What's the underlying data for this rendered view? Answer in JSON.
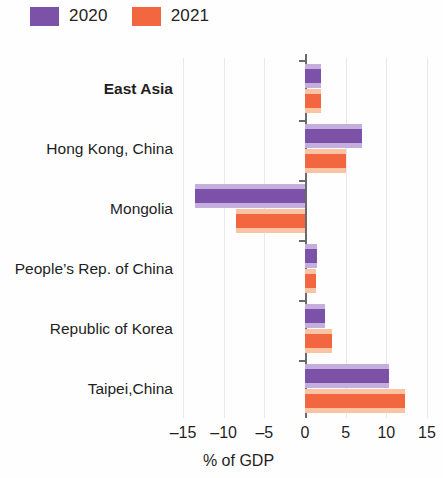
{
  "legend": {
    "items": [
      {
        "label": "2020",
        "color": "#7b52a8",
        "name": "legend-swatch-2020"
      },
      {
        "label": "2021",
        "color": "#f2673f",
        "name": "legend-swatch-2021"
      }
    ]
  },
  "axis": {
    "title": "% of GDP",
    "ticks": [
      "–15",
      "–10",
      "–5",
      "0",
      "5",
      "10",
      "15"
    ],
    "tick_values": [
      -15,
      -10,
      -5,
      0,
      5,
      10,
      15
    ]
  },
  "chart_data": {
    "type": "bar",
    "orientation": "horizontal",
    "title": "",
    "subtitle": "",
    "xlabel": "% of GDP",
    "ylabel": "",
    "xlim": [
      -15,
      15
    ],
    "grid": true,
    "legend_position": "top-left",
    "categories": [
      "East Asia",
      "Hong Kong, China",
      "Mongolia",
      "People’s Rep. of China",
      "Republic of Korea",
      "Taipei,China"
    ],
    "emphasized_categories": [
      "East Asia"
    ],
    "series": [
      {
        "name": "2020",
        "color": "#7b52a8",
        "values": [
          2.0,
          7.0,
          -13.5,
          1.5,
          2.5,
          10.3
        ]
      },
      {
        "name": "2021",
        "color": "#f2673f",
        "values": [
          2.0,
          5.0,
          -8.5,
          1.3,
          3.3,
          12.3
        ]
      }
    ]
  }
}
